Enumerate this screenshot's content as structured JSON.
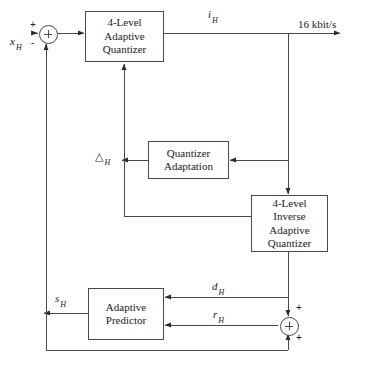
{
  "diagram": {
    "stroke_color": "#4a4a4a",
    "text_color": "#1a1a1a",
    "background": "#ffffff",
    "blocks": [
      {
        "id": "quantizer",
        "lines": [
          "4-Level",
          "Adaptive",
          "Quantizer"
        ]
      },
      {
        "id": "quantizer-adapt",
        "lines": [
          "Quantizer",
          "Adaptation"
        ]
      },
      {
        "id": "inverse-quantizer",
        "lines": [
          "4-Level",
          "Inverse",
          "Adaptive",
          "Quantizer"
        ]
      },
      {
        "id": "adaptive-predictor",
        "lines": [
          "Adaptive",
          "Predictor"
        ]
      }
    ],
    "signals": {
      "input": {
        "base": "x",
        "sub": "H"
      },
      "quantizer_index": {
        "base": "i",
        "sub": "H"
      },
      "step_size": {
        "base": "△",
        "sub": "H"
      },
      "reconstructed": {
        "base": "s",
        "sub": "H"
      },
      "difference": {
        "base": "d",
        "sub": "H"
      },
      "residual": {
        "base": "r",
        "sub": "H"
      }
    },
    "bitrate_label": "16 kbit/s",
    "signs": {
      "summer_in_plus": "+",
      "summer_in_minus": "-",
      "summer_out_plus_top": "+",
      "summer_out_plus_bottom": "+"
    }
  }
}
